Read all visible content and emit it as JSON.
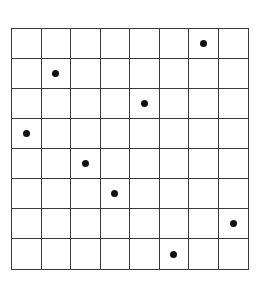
{
  "diagram": {
    "type": "grid-with-markers",
    "rows": 8,
    "cols": 8,
    "line_color": "#3a3a3a",
    "dot_color": "#111111",
    "background": "#ffffff",
    "markers": [
      {
        "row": 0,
        "col": 6
      },
      {
        "row": 1,
        "col": 1
      },
      {
        "row": 2,
        "col": 4
      },
      {
        "row": 3,
        "col": 0
      },
      {
        "row": 4,
        "col": 2
      },
      {
        "row": 5,
        "col": 3
      },
      {
        "row": 6,
        "col": 7
      },
      {
        "row": 7,
        "col": 5
      }
    ]
  }
}
